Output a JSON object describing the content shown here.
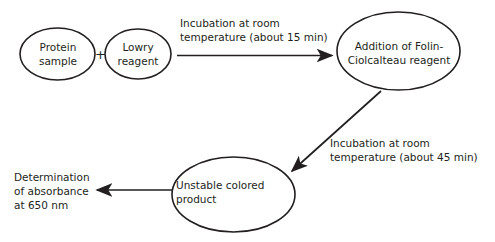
{
  "diagram": {
    "background_color": "#ffffff",
    "stroke_color": "#231f20",
    "nodes": [
      {
        "id": "protein-sample",
        "label": "Protein\nsample",
        "shape": "ellipse"
      },
      {
        "id": "lowry-reagent",
        "label": "Lowry\nreagent",
        "shape": "ellipse"
      },
      {
        "id": "folin-addition",
        "label": "Addition of Folin-\nCiolcalteau reagent",
        "shape": "ellipse"
      },
      {
        "id": "unstable-product",
        "label": "Unstable colored\nproduct",
        "shape": "ellipse"
      }
    ],
    "operators": [
      {
        "id": "plus",
        "symbol": "+"
      }
    ],
    "edges": [
      {
        "id": "edge-incubation-15",
        "label": "Incubation at room\ntemperature (about 15 min)",
        "direction": "right"
      },
      {
        "id": "edge-incubation-45",
        "label": "Incubation at room\ntemperature (about 45 min)",
        "direction": "down-left"
      },
      {
        "id": "edge-absorbance",
        "label": "Determination\nof absorbance\nat 650 nm",
        "direction": "left"
      }
    ]
  }
}
